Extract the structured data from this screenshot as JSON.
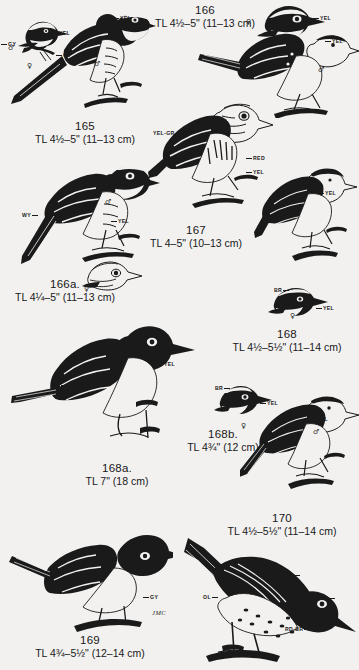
{
  "plate": {
    "title": "Wood warbler field-guide plate",
    "background_color": "#f2f1ef",
    "ink_color": "#1a1a1a",
    "artist_signature": "JMC"
  },
  "entries": [
    {
      "id": "165",
      "number": "165",
      "tl": "TL 4½–5\" (11–13 cm)",
      "part_labels": [
        "GY",
        "YEL",
        "GY",
        "YEL"
      ],
      "sex_symbols": [
        "♂",
        "♀",
        "♂"
      ]
    },
    {
      "id": "166",
      "number": "166",
      "tl": "TL 4½–5\" (11–13 cm)",
      "part_labels": [
        "YEL",
        "YEL"
      ],
      "sex_symbols": [
        "♀",
        "♂"
      ]
    },
    {
      "id": "166a",
      "number": "166a.",
      "tl": "TL 4¼–5\" (11–13 cm)",
      "part_labels": [
        "WY",
        "YEL",
        "YEL"
      ],
      "sex_symbols": [
        "♂",
        "♀"
      ]
    },
    {
      "id": "167",
      "number": "167",
      "tl": "TL 4–5\" (10–13 cm)",
      "part_labels": [
        "YEL-GR",
        "RED",
        "YEL"
      ],
      "sex_symbols": []
    },
    {
      "id": "168",
      "number": "168",
      "tl": "TL 4½–5½\" (11–14 cm)",
      "part_labels": [
        "YEL",
        "BR",
        "YEL"
      ],
      "sex_symbols": [
        "♀"
      ]
    },
    {
      "id": "168a",
      "number": "168a.",
      "tl": "TL 7\" (18 cm)",
      "part_labels": [
        "BR",
        "YEL"
      ],
      "sex_symbols": []
    },
    {
      "id": "168b",
      "number": "168b.",
      "tl": "TL 4¾\" (12 cm)",
      "part_labels": [
        "BR",
        "YEL",
        "YEL"
      ],
      "sex_symbols": [
        "♀",
        "♂"
      ]
    },
    {
      "id": "169",
      "number": "169",
      "tl": "TL 4¾–5½\" (12–14 cm)",
      "part_labels": [
        "GY"
      ],
      "sex_symbols": []
    },
    {
      "id": "170",
      "number": "170",
      "tl": "TL 4½–5½\" (11–14 cm)",
      "part_labels": [
        "OL",
        "OL",
        "DR",
        "RD-BR"
      ],
      "sex_symbols": []
    }
  ]
}
